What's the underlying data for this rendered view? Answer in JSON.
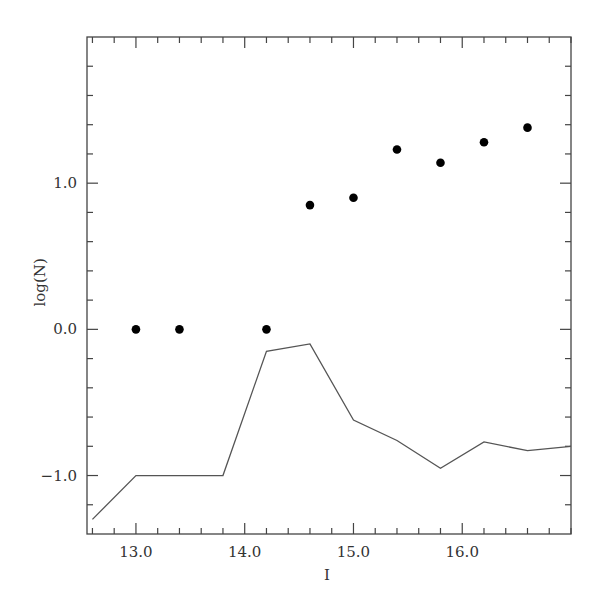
{
  "chart_data": {
    "type": "scatter",
    "title": "",
    "xlabel": "I",
    "ylabel": "log(N)",
    "xlim": [
      12.55,
      17.0
    ],
    "ylim": [
      -1.4,
      2.0
    ],
    "grid": false,
    "legend": null,
    "x_ticks_major": [
      13.0,
      14.0,
      15.0,
      16.0
    ],
    "x_tick_labels": [
      "13.0",
      "14.0",
      "15.0",
      "16.0"
    ],
    "x_ticks_minor_step": 0.2,
    "y_ticks_major": [
      -1.0,
      0.0,
      1.0
    ],
    "y_tick_labels": [
      "−1.0",
      "0.0",
      "1.0"
    ],
    "y_ticks_minor_step": 0.2,
    "series": [
      {
        "name": "observed counts",
        "kind": "scatter",
        "marker": "filled-circle",
        "color": "#000000",
        "x": [
          13.0,
          13.4,
          14.2,
          14.6,
          15.0,
          15.4,
          15.8,
          16.2,
          16.6
        ],
        "y": [
          0.0,
          0.0,
          0.0,
          0.85,
          0.9,
          1.23,
          1.14,
          1.28,
          1.38
        ]
      },
      {
        "name": "model / comparison",
        "kind": "line",
        "color": "#555555",
        "x": [
          12.6,
          13.0,
          13.8,
          14.2,
          14.6,
          15.0,
          15.4,
          15.8,
          16.2,
          16.6,
          17.0
        ],
        "y": [
          -1.3,
          -1.0,
          -1.0,
          -0.15,
          -0.1,
          -0.62,
          -0.76,
          -0.95,
          -0.77,
          -0.83,
          -0.8
        ]
      }
    ]
  },
  "layout": {
    "frame": {
      "left": 87,
      "top": 37,
      "right": 571,
      "bottom": 534
    }
  }
}
